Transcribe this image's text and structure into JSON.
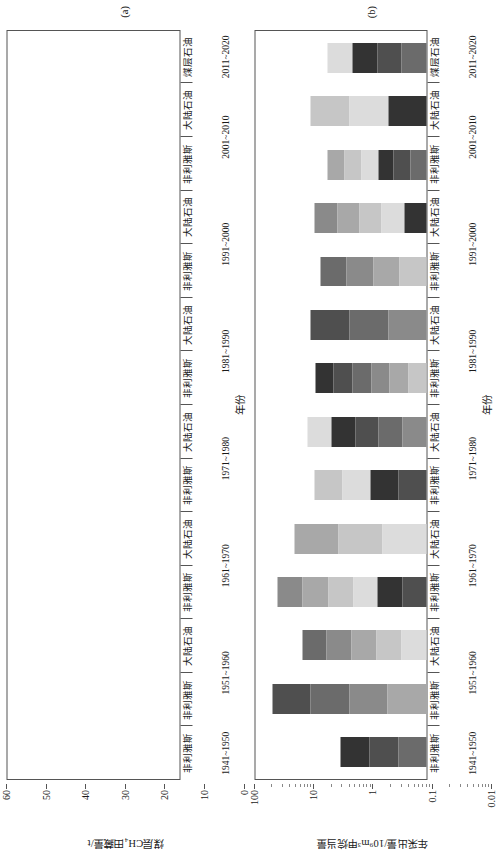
{
  "figure": {
    "panels": [
      {
        "label": "(a)",
        "xtitle": "年份",
        "ytitle": "煤层CH₄田藏量/t",
        "yticks": [
          "60",
          "50",
          "40",
          "30",
          "20",
          "10",
          "0"
        ]
      },
      {
        "label": "(b)",
        "xtitle": "年份",
        "ytitle": "年采出量/10⁹m³甲烷当量",
        "yticks": [
          "100",
          "10",
          "1",
          "0.1",
          "0.01"
        ]
      }
    ],
    "categories": [
      {
        "name": "非利雅斯",
        "decade": "1941~1950"
      },
      {
        "name": "非利雅斯",
        "decade": "1951~1960"
      },
      {
        "name": "大陆石油",
        "decade": "1951~1960"
      },
      {
        "name": "非利雅斯",
        "decade": "1961~1970"
      },
      {
        "name": "大陆石油",
        "decade": "1961~1970"
      },
      {
        "name": "非利雅斯",
        "decade": "1971~1980"
      },
      {
        "name": "大陆石油",
        "decade": "1971~1980"
      },
      {
        "name": "非利雅斯",
        "decade": "1981~1990"
      },
      {
        "name": "大陆石油",
        "decade": "1981~1990"
      },
      {
        "name": "非利雅斯",
        "decade": "1991~2000"
      },
      {
        "name": "大陆石油",
        "decade": "1991~2000"
      },
      {
        "name": "非利雅斯",
        "decade": "2001~2010"
      },
      {
        "name": "大陆石油",
        "decade": "2001~2010"
      },
      {
        "name": "煤层石油",
        "decade": "2011~2020"
      }
    ]
  },
  "chart_data": [
    {
      "type": "bar",
      "stacked": true,
      "title": "(a)",
      "xlabel": "年份",
      "ylabel": "煤层CH₄田藏量/t",
      "ylim": [
        0,
        60
      ],
      "yticks": [
        0,
        10,
        20,
        30,
        40,
        50,
        60
      ],
      "scale": "linear",
      "grid": false,
      "legend": "none",
      "categories": [
        "1941~1950 非利雅斯",
        "1951~1960 非利雅斯",
        "1951~1960 大陆石油",
        "1961~1970 非利雅斯",
        "1961~1970 大陆石油",
        "1971~1980 非利雅斯",
        "1971~1980 大陆石油",
        "1981~1990 非利雅斯",
        "1981~1990 大陆石油",
        "1991~2000 非利雅斯",
        "1991~2000 大陆石油",
        "2001~2010 非利雅斯",
        "2001~2010 大陆石油",
        "2011~2020 煤层石油"
      ],
      "series": [
        {
          "name": "层段1",
          "color": "#5a5a5a",
          "values": [
            2.0,
            4.0,
            3.5,
            18.0,
            26.0,
            27.0,
            21.0,
            24.0,
            31.0,
            25.0,
            23.0,
            3.0,
            22.0,
            11.0
          ]
        },
        {
          "name": "层段2",
          "color": "#6e6e6e",
          "values": [
            0.6,
            1.0,
            1.2,
            3.0,
            4.0,
            4.0,
            3.0,
            3.0,
            4.5,
            2.0,
            1.5,
            0.5,
            3.0,
            2.0
          ]
        },
        {
          "name": "层段3",
          "color": "#8a8a8a",
          "values": [
            0.4,
            0.8,
            1.0,
            2.0,
            2.5,
            3.5,
            2.0,
            2.5,
            3.0,
            1.5,
            1.2,
            0.4,
            2.0,
            1.5
          ]
        },
        {
          "name": "层段4",
          "color": "#a5a5a5",
          "values": [
            0.3,
            0.6,
            0.8,
            1.5,
            2.0,
            3.0,
            1.5,
            2.0,
            2.5,
            1.2,
            1.0,
            0.3,
            1.5,
            1.0
          ]
        },
        {
          "name": "层段5",
          "color": "#bdbdbd",
          "values": [
            0.2,
            0.5,
            0.6,
            1.0,
            1.5,
            3.5,
            1.2,
            1.6,
            2.0,
            1.0,
            0.8,
            0.2,
            1.2,
            0.8
          ]
        },
        {
          "name": "层段6",
          "color": "#d2d2d2",
          "values": [
            0.1,
            0.4,
            0.5,
            0.8,
            1.0,
            3.0,
            1.0,
            1.4,
            1.6,
            0.8,
            0.6,
            0.2,
            1.0,
            0.6
          ]
        },
        {
          "name": "层段7",
          "color": "#2e2e2e",
          "values": [
            0.1,
            0.9,
            0.8,
            1.2,
            0.3,
            0.3,
            0.2,
            0.3,
            1.2,
            0.2,
            0.2,
            0.1,
            0.2,
            0.1
          ]
        }
      ],
      "totals": [
        3.7,
        8.2,
        8.4,
        27.5,
        37.3,
        44.3,
        29.9,
        34.8,
        45.8,
        31.7,
        28.3,
        4.7,
        30.9,
        17.0
      ]
    },
    {
      "type": "bar",
      "stacked": true,
      "title": "(b)",
      "xlabel": "年份",
      "ylabel": "年采出量/10⁹m³甲烷当量",
      "scale": "log",
      "ylim": [
        0.01,
        100
      ],
      "yticks": [
        0.01,
        0.1,
        1,
        10,
        100
      ],
      "grid": false,
      "legend": "none",
      "categories": [
        "1941~1950 非利雅斯",
        "1951~1960 非利雅斯",
        "1951~1960 大陆石油",
        "1961~1970 非利雅斯",
        "1961~1970 大陆石油",
        "1971~1980 非利雅斯",
        "1971~1980 大陆石油",
        "1981~1990 非利雅斯",
        "1981~1990 大陆石油",
        "1991~2000 非利雅斯",
        "1991~2000 大陆石油",
        "2001~2010 非利雅斯",
        "2001~2010 大陆石油",
        "2011~2020 煤层石油"
      ],
      "totals": [
        1.0,
        40.0,
        8.0,
        30.0,
        12.0,
        4.0,
        6.0,
        4.0,
        5.0,
        3.0,
        4.0,
        2.0,
        5.0,
        2.0
      ]
    }
  ]
}
